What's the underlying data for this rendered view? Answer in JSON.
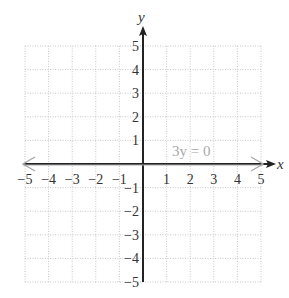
{
  "header": {
    "cutoff_text": ""
  },
  "chart_data": {
    "type": "line",
    "title": "",
    "xlabel": "x",
    "ylabel": "y",
    "xlim": [
      -5,
      5
    ],
    "ylim": [
      -5,
      5
    ],
    "grid": true,
    "x_ticks": [
      -5,
      -4,
      -3,
      -2,
      -1,
      1,
      2,
      3,
      4,
      5
    ],
    "y_ticks": [
      5,
      4,
      3,
      2,
      1,
      -1,
      -2,
      -3,
      -4,
      -5
    ],
    "x_tick_labels": [
      "−5",
      "−4",
      "−3",
      "−2",
      "−1",
      "1",
      "2",
      "3",
      "4",
      "5"
    ],
    "y_tick_labels": [
      "5",
      "4",
      "3",
      "2",
      "1",
      "−1",
      "−2",
      "−3",
      "−4",
      "−5"
    ],
    "series": [
      {
        "name": "3y = 0",
        "equation": "3y = 0",
        "x": [
          -5,
          5
        ],
        "y": [
          0,
          0
        ],
        "color": "#a9a9a9"
      }
    ],
    "annotations": [
      {
        "text": "3y = 0",
        "x": 2.5,
        "y": 0.5
      }
    ]
  },
  "colors": {
    "axis": "#222222",
    "grid": "#c8c8c8",
    "line": "#a9a9a9",
    "text": "#333333"
  }
}
